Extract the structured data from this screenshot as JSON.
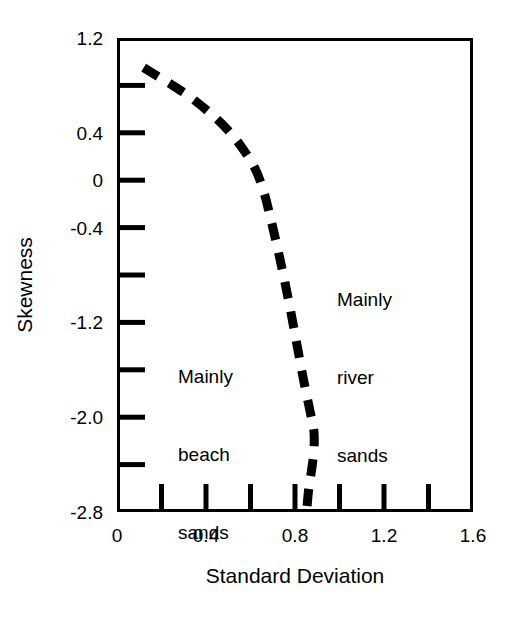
{
  "chart_data": {
    "type": "line",
    "title": "",
    "subtitle": "",
    "xlabel": "Standard Deviation",
    "ylabel": "Skewness",
    "xlim": [
      0,
      1.6
    ],
    "ylim": [
      -2.8,
      1.2
    ],
    "grid": false,
    "legend": null,
    "legend_position": "none",
    "x_ticks_labeled": [
      "0",
      "0.4",
      "0.8",
      "1.2",
      "1.6"
    ],
    "x_ticks_labeled_values": [
      0,
      0.4,
      0.8,
      1.2,
      1.6
    ],
    "x_ticks_minor_values": [
      0.2,
      0.4,
      0.6,
      0.8,
      1.0,
      1.2,
      1.4
    ],
    "y_ticks_labeled": [
      "1.2",
      "0.4",
      "0",
      "-0.4",
      "-1.2",
      "-2.0",
      "-2.8"
    ],
    "y_ticks_labeled_values": [
      1.2,
      0.4,
      0,
      -0.4,
      -1.2,
      -2.0,
      -2.8
    ],
    "y_ticks_minor_values": [
      0.8,
      0.4,
      0.0,
      -0.4,
      -0.8,
      -1.2,
      -1.6,
      -2.0,
      -2.4
    ],
    "series": [
      {
        "name": "beach-river discriminant boundary",
        "style": "dashed",
        "color": "#000000",
        "linewidth": 9,
        "points": [
          [
            0.12,
            0.95
          ],
          [
            0.18,
            0.88
          ],
          [
            0.25,
            0.8
          ],
          [
            0.33,
            0.7
          ],
          [
            0.41,
            0.58
          ],
          [
            0.49,
            0.44
          ],
          [
            0.56,
            0.28
          ],
          [
            0.62,
            0.1
          ],
          [
            0.66,
            -0.1
          ],
          [
            0.69,
            -0.32
          ],
          [
            0.72,
            -0.56
          ],
          [
            0.75,
            -0.82
          ],
          [
            0.78,
            -1.1
          ],
          [
            0.81,
            -1.4
          ],
          [
            0.84,
            -1.7
          ],
          [
            0.87,
            -1.97
          ],
          [
            0.885,
            -2.12
          ],
          [
            0.885,
            -2.28
          ],
          [
            0.875,
            -2.44
          ],
          [
            0.862,
            -2.6
          ],
          [
            0.852,
            -2.8
          ]
        ]
      }
    ],
    "annotations": [
      {
        "name": "mainly-beach-sands",
        "lines": [
          "Mainly",
          "beach",
          "sands"
        ],
        "x": 0.28,
        "y": -1.2
      },
      {
        "name": "mainly-river-sands",
        "lines": [
          "Mainly",
          "river",
          "sands"
        ],
        "x": 0.99,
        "y": -0.55
      }
    ]
  },
  "axes": {
    "x_title": "Standard Deviation",
    "y_title": "Skewness",
    "x_labels": [
      {
        "text": "0",
        "value": 0.0
      },
      {
        "text": "0.4",
        "value": 0.4
      },
      {
        "text": "0.8",
        "value": 0.8
      },
      {
        "text": "1.2",
        "value": 1.2
      },
      {
        "text": "1.6",
        "value": 1.6
      }
    ],
    "y_labels": [
      {
        "text": "1.2",
        "value": 1.2
      },
      {
        "text": "0.4",
        "value": 0.4
      },
      {
        "text": "0",
        "value": 0.0
      },
      {
        "text": "-0.4",
        "value": -0.4
      },
      {
        "text": "-1.2",
        "value": -1.2
      },
      {
        "text": "-2.0",
        "value": -2.0
      },
      {
        "text": "-2.8",
        "value": -2.8
      }
    ]
  },
  "regions": {
    "beach": {
      "line1": "Mainly",
      "line2": "beach",
      "line3": "sands"
    },
    "river": {
      "line1": "Mainly",
      "line2": "river",
      "line3": "sands"
    }
  },
  "colors": {
    "ink": "#000000",
    "background": "#ffffff"
  }
}
